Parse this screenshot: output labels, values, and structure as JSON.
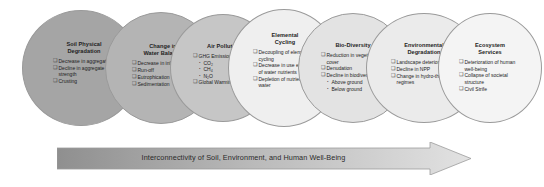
{
  "diagram": {
    "title": "Interconnectivity of Soil, Environment, and Human Well-Being",
    "bullet_glyph": "❑",
    "sub_bullet_glyph": "•",
    "arrow": {
      "label": "Interconnectivity of Soil, Environment, and Human Well-Being",
      "gradient_start_color": "#8f8f8f",
      "gradient_end_color": "#dedede"
    },
    "stages": [
      {
        "id": "soil-physical-degradation",
        "title_line1": "Soil Physical",
        "title_line2": "Degradation",
        "fill_color": "#a5a5a5",
        "items": [
          {
            "text": "Decrease in aggregation"
          },
          {
            "text": "Decline in aggregate strength"
          },
          {
            "text": "Crusting"
          }
        ]
      },
      {
        "id": "change-in-water-balance",
        "title_line1": "Change in",
        "title_line2": "Water Balance",
        "fill_color": "#b4b4b4",
        "items": [
          {
            "text": "Decrease in infiltration"
          },
          {
            "text": "Run-off"
          },
          {
            "text": "Eutrophication"
          },
          {
            "text": "Sedimentation"
          }
        ]
      },
      {
        "id": "air-pollution",
        "title_line1": "Air Pollution",
        "title_line2": "",
        "fill_color": "#c6c6c6",
        "items": [
          {
            "text": "GHG Emissions",
            "sub_items": [
              "CO₂",
              "CH₄",
              "N₂O"
            ]
          },
          {
            "text": "Global Warming"
          }
        ]
      },
      {
        "id": "elemental-cycling",
        "title_line1": "Elemental",
        "title_line2": "Cycling",
        "fill_color": "#efefef",
        "items": [
          {
            "text": "Decoupling of elemental cycling"
          },
          {
            "text": "Decrease in use efficiency of water nutrients"
          },
          {
            "text": "Depletion of nutrients in water"
          }
        ]
      },
      {
        "id": "bio-diversity",
        "title_line1": "Bio-Diversity",
        "title_line2": "",
        "fill_color": "#e3e3e3",
        "items": [
          {
            "text": "Reduction in vegetation cover"
          },
          {
            "text": "Denudation"
          },
          {
            "text": "Decline in biodiversity",
            "sub_items": [
              "Above ground",
              "Below ground"
            ]
          }
        ]
      },
      {
        "id": "environmental-degradation",
        "title_line1": "Environmental",
        "title_line2": "Degradation",
        "fill_color": "#ebebeb",
        "items": [
          {
            "text": "Landscape deterioration"
          },
          {
            "text": "Decline in NPP"
          },
          {
            "text": "Change in hydro-thermal regimes"
          }
        ]
      },
      {
        "id": "ecosystem-services",
        "title_line1": "Ecosystem",
        "title_line2": "Services",
        "fill_color": "#f4f4f4",
        "items": [
          {
            "text": "Deterioration of human well-being"
          },
          {
            "text": "Collapse of societal structure"
          },
          {
            "text": "Civil Strife"
          }
        ]
      }
    ]
  }
}
